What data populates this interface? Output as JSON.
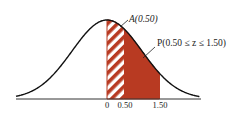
{
  "diagram": {
    "type": "normal-distribution-shaded-area",
    "labels": {
      "area_a": "A(0.50)",
      "area_p": "P(0.50 ≤ z ≤ 1.50)"
    },
    "axis_ticks": [
      {
        "value": 0,
        "label": "0"
      },
      {
        "value": 0.5,
        "label": "0.50"
      },
      {
        "value": 1.5,
        "label": "1.50"
      }
    ],
    "regions": [
      {
        "name": "A(0.50)",
        "from": 0,
        "to": 0.5,
        "style": "hatched"
      },
      {
        "name": "P(0.50 ≤ z ≤ 1.50)",
        "from": 0.5,
        "to": 1.5,
        "style": "solid"
      }
    ],
    "colors": {
      "fill": "#b83a22",
      "curve": "#111111"
    }
  }
}
